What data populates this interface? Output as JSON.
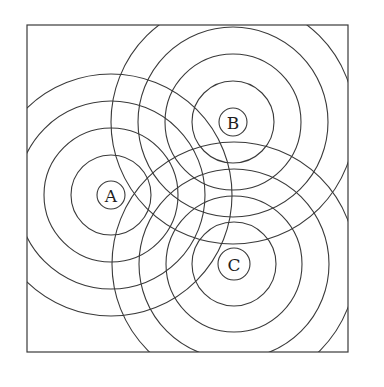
{
  "diagram": {
    "type": "concentric-wave-rings",
    "frame": {
      "x": 27,
      "y": 25,
      "width": 321,
      "height": 327
    },
    "stroke_color": "#3a3a3a",
    "background": "#ffffff",
    "sources": [
      {
        "id": "A",
        "label": "A",
        "cx": 111,
        "cy": 195,
        "radii": [
          14,
          40,
          67,
          94,
          121
        ]
      },
      {
        "id": "B",
        "label": "B",
        "cx": 233,
        "cy": 122,
        "radii": [
          14,
          41,
          68,
          95,
          122
        ]
      },
      {
        "id": "C",
        "label": "C",
        "cx": 234,
        "cy": 264,
        "radii": [
          16,
          42,
          68,
          95,
          122
        ]
      }
    ]
  }
}
